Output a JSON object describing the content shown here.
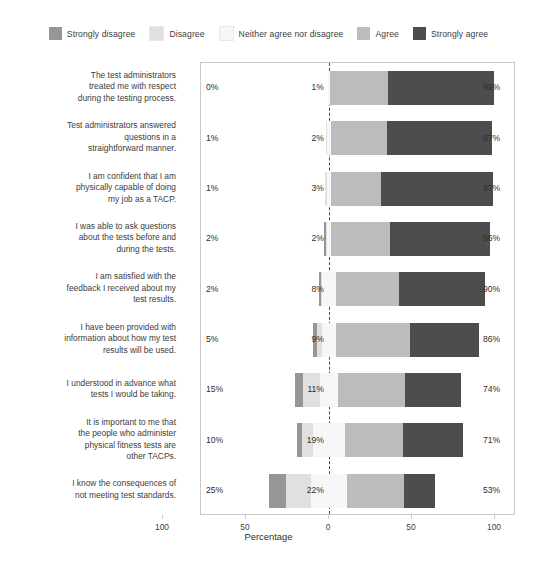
{
  "chart_data": {
    "type": "bar",
    "subtype": "diverging-stacked-likert",
    "title": "",
    "xlabel": "Percentage",
    "ylabel": "",
    "xlim": [
      -100,
      100
    ],
    "xticks": [
      100,
      50,
      0,
      50,
      100
    ],
    "xtick_labels": [
      "100",
      "50",
      "0",
      "50",
      "100"
    ],
    "grid": false,
    "legend_position": "top-center",
    "zero_reference_line": true,
    "legend": [
      {
        "label": "Strongly disagree",
        "color": "#969696"
      },
      {
        "label": "Disagree",
        "color": "#e0e0e0"
      },
      {
        "label": "Neither agree nor disagree",
        "color": "#f7f7f7"
      },
      {
        "label": "Agree",
        "color": "#bcbcbc"
      },
      {
        "label": "Strongly agree",
        "color": "#4d4d4d"
      }
    ],
    "series": [
      {
        "name": "Strongly disagree",
        "values": [
          0,
          0,
          0,
          1,
          1,
          2,
          5,
          3,
          10
        ]
      },
      {
        "name": "Disagree",
        "values": [
          0,
          1,
          1,
          1,
          1,
          3,
          10,
          7,
          15
        ]
      },
      {
        "name": "Neither agree nor disagree",
        "values": [
          1,
          2,
          3,
          2,
          8,
          9,
          11,
          19,
          22
        ]
      },
      {
        "name": "Agree",
        "values": [
          35,
          34,
          30,
          36,
          38,
          44,
          40,
          35,
          34
        ]
      },
      {
        "name": "Strongly agree",
        "values": [
          64,
          63,
          67,
          60,
          52,
          42,
          34,
          36,
          19
        ]
      }
    ],
    "categories": [
      "The test administrators treated me with respect during the testing process.",
      "Test administrators answered questions in a straightforward manner.",
      "I am confident that I am physically capable of doing my job as a TACP.",
      "I was able to ask questions about the tests before and during the tests.",
      "I am satisfied with the feedback I received about my test results.",
      "I have been provided with information about how my test results will be used.",
      "I understood in advance what tests I would be taking.",
      "It is important to me that the people who administer physical fitness tests are other TACPs.",
      "I know the consequences of not meeting test standards."
    ],
    "rows": [
      {
        "category_lines": [
          "The test administrators",
          "treated me with respect",
          "during the testing process."
        ],
        "negative_label": "0%",
        "neutral_label": "1%",
        "positive_label": "99%",
        "strongly_disagree": 0,
        "disagree": 0,
        "neither": 1,
        "agree": 35,
        "strongly_agree": 64
      },
      {
        "category_lines": [
          "Test administrators answered",
          "questions in a",
          "straightforward manner."
        ],
        "negative_label": "1%",
        "neutral_label": "2%",
        "positive_label": "97%",
        "strongly_disagree": 0,
        "disagree": 1,
        "neither": 2,
        "agree": 34,
        "strongly_agree": 63
      },
      {
        "category_lines": [
          "I am confident that I am",
          "physically capable of doing",
          "my job as a TACP."
        ],
        "negative_label": "1%",
        "neutral_label": "3%",
        "positive_label": "97%",
        "strongly_disagree": 0,
        "disagree": 1,
        "neither": 3,
        "agree": 30,
        "strongly_agree": 67
      },
      {
        "category_lines": [
          "I was able to ask questions",
          "about the tests before and",
          "during the tests."
        ],
        "negative_label": "2%",
        "neutral_label": "2%",
        "positive_label": "96%",
        "strongly_disagree": 1,
        "disagree": 1,
        "neither": 2,
        "agree": 36,
        "strongly_agree": 60
      },
      {
        "category_lines": [
          "I am satisfied with the",
          "feedback I received about my",
          "test results."
        ],
        "negative_label": "2%",
        "neutral_label": "8%",
        "positive_label": "90%",
        "strongly_disagree": 1,
        "disagree": 1,
        "neither": 8,
        "agree": 38,
        "strongly_agree": 52
      },
      {
        "category_lines": [
          "I have been provided with",
          "information about how my test",
          "results will be used."
        ],
        "negative_label": "5%",
        "neutral_label": "9%",
        "positive_label": "86%",
        "strongly_disagree": 2,
        "disagree": 3,
        "neither": 9,
        "agree": 44,
        "strongly_agree": 42
      },
      {
        "category_lines": [
          "I understood in advance what",
          "tests I would be taking."
        ],
        "negative_label": "15%",
        "neutral_label": "11%",
        "positive_label": "74%",
        "strongly_disagree": 5,
        "disagree": 10,
        "neither": 11,
        "agree": 40,
        "strongly_agree": 34
      },
      {
        "category_lines": [
          "It is important to me that",
          "the people who administer",
          "physical fitness tests are",
          "other TACPs."
        ],
        "negative_label": "10%",
        "neutral_label": "19%",
        "positive_label": "71%",
        "strongly_disagree": 3,
        "disagree": 7,
        "neither": 19,
        "agree": 35,
        "strongly_agree": 36
      },
      {
        "category_lines": [
          "I know the consequences of",
          "not meeting test standards."
        ],
        "negative_label": "25%",
        "neutral_label": "22%",
        "positive_label": "53%",
        "strongly_disagree": 10,
        "disagree": 15,
        "neither": 22,
        "agree": 34,
        "strongly_agree": 19
      }
    ]
  }
}
